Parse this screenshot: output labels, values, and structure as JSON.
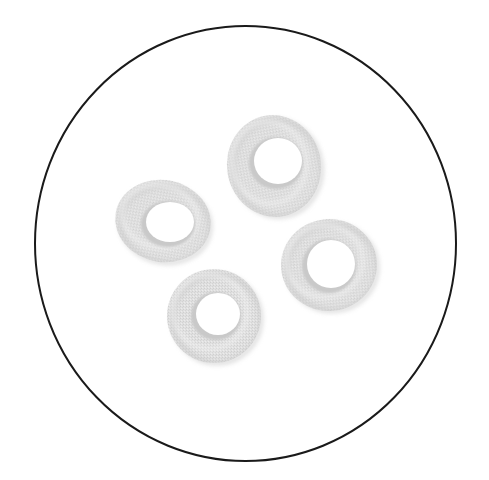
{
  "image": {
    "description": "Microscope field of view showing four red blood cells (biconcave discs) drawn in grayscale",
    "background": "#ffffff",
    "field": {
      "cx": 245.5,
      "cy": 243.5,
      "rx": 210.5,
      "ry": 217.5,
      "stroke": "#1a1a1a",
      "stroke_width": 2
    },
    "cell_colors": {
      "fill": "#dedede",
      "shade": "#c9c9c9",
      "highlight": "#f2f2f2",
      "hole": "#ffffff"
    },
    "cells": [
      {
        "name": "cell-top",
        "cx": 274,
        "cy": 166,
        "rx": 47,
        "ry": 51,
        "rot": -10,
        "hole_cx": 278,
        "hole_cy": 161,
        "hole_rx": 24,
        "hole_ry": 23
      },
      {
        "name": "cell-left",
        "cx": 163,
        "cy": 221,
        "rx": 48,
        "ry": 41,
        "rot": 10,
        "hole_cx": 170,
        "hole_cy": 222,
        "hole_rx": 24,
        "hole_ry": 20
      },
      {
        "name": "cell-bottom",
        "cx": 214,
        "cy": 316,
        "rx": 47,
        "ry": 47,
        "rot": 0,
        "hole_cx": 218,
        "hole_cy": 314,
        "hole_rx": 22,
        "hole_ry": 21
      },
      {
        "name": "cell-right",
        "cx": 329,
        "cy": 265,
        "rx": 48,
        "ry": 46,
        "rot": -5,
        "hole_cx": 331,
        "hole_cy": 264,
        "hole_rx": 24,
        "hole_ry": 24
      }
    ]
  }
}
